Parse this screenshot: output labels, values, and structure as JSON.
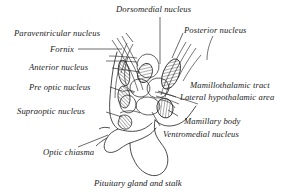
{
  "figure": {
    "caption": "Pituitary gland and stalk",
    "ink_color": "#2b2b2b",
    "background_color": "#ffffff"
  },
  "labels": {
    "dorsomedial_nucleus": "Dorsomedial nucleus",
    "paraventricular_nucleus": "Paraventricular nucleus",
    "posterior_nucleus": "Posterior nucleus",
    "fornix": "Fornix",
    "anterior_nucleus": "Anterior nucleus",
    "pre_optic_nucleus": "Pre optic nucleus",
    "supraoptic_nucleus": "Supraoptic nucleus",
    "mamillothalamic_tract": "Mamillothalamic tract",
    "lateral_hypothalamic_area": "Lateral hypothalamic area",
    "mamillary_body": "Mamillary body",
    "ventromedial_nucleus": "Ventromedial nucleus",
    "optic_chiasma": "Optic chiasma"
  }
}
